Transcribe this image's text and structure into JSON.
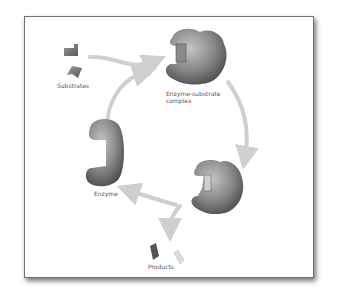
{
  "diagram": {
    "labels": {
      "substrates": "Substrates",
      "complex_line1": "Enzyme-substrate",
      "complex_line2": "complex",
      "enzyme": "Enzyme",
      "products": "Products"
    },
    "colors": {
      "enzyme": "#7a7a7a",
      "arrow": "#cfcfcf",
      "frame_border": "#6f6f6f",
      "label": "#555555"
    }
  }
}
